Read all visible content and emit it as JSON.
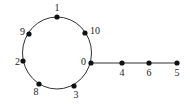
{
  "diagram": {
    "type": "graph",
    "colors": {
      "edge": "#333333",
      "node": "#111111",
      "label": "#222222",
      "background": "#ffffff"
    },
    "cycle": {
      "center": [
        57,
        53
      ],
      "rx": 34.5,
      "ry": 36
    },
    "nodes": [
      {
        "id": "1",
        "label": "1",
        "x": 57,
        "y": 17,
        "lx": 57,
        "ly": 11,
        "anchor": "middle"
      },
      {
        "id": "10",
        "label": "10",
        "x": 85,
        "y": 33,
        "lx": 90,
        "ly": 34,
        "anchor": "start"
      },
      {
        "id": "0",
        "label": "0",
        "x": 91,
        "y": 63,
        "lx": 86,
        "ly": 65,
        "anchor": "end"
      },
      {
        "id": "3",
        "label": "3",
        "x": 74,
        "y": 86,
        "lx": 76,
        "ly": 98,
        "anchor": "middle"
      },
      {
        "id": "8",
        "label": "8",
        "x": 39,
        "y": 84,
        "lx": 36,
        "ly": 95,
        "anchor": "middle"
      },
      {
        "id": "2",
        "label": "2",
        "x": 23,
        "y": 61,
        "lx": 20,
        "ly": 65,
        "anchor": "end"
      },
      {
        "id": "9",
        "label": "9",
        "x": 29,
        "y": 34,
        "lx": 25,
        "ly": 35,
        "anchor": "end"
      },
      {
        "id": "4",
        "label": "4",
        "x": 122,
        "y": 63,
        "lx": 122,
        "ly": 76,
        "anchor": "middle"
      },
      {
        "id": "6",
        "label": "6",
        "x": 149,
        "y": 63,
        "lx": 149,
        "ly": 76,
        "anchor": "middle"
      },
      {
        "id": "5",
        "label": "5",
        "x": 177,
        "y": 63,
        "lx": 177,
        "ly": 76,
        "anchor": "middle"
      }
    ],
    "cycle_order": [
      "1",
      "10",
      "0",
      "3",
      "8",
      "2",
      "9"
    ],
    "tail_edges": [
      [
        "0",
        "4"
      ],
      [
        "4",
        "6"
      ],
      [
        "6",
        "5"
      ]
    ]
  }
}
